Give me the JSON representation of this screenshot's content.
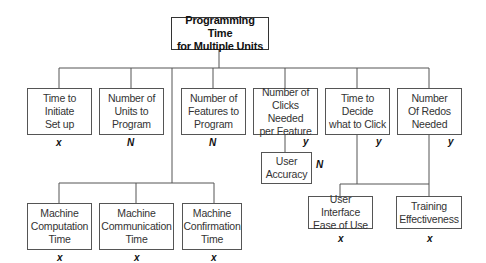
{
  "root": {
    "label": "Programming Time\nfor Multiple Units"
  },
  "nodes": [
    {
      "id": "time-initiate",
      "label": "Time to\nInitiate\nSet up",
      "var": "x"
    },
    {
      "id": "units-program",
      "label": "Number of\nUnits to\nProgram",
      "var": "N"
    },
    {
      "id": "features-program",
      "label": "Number of\nFeatures to\nProgram",
      "var": "N"
    },
    {
      "id": "clicks-needed",
      "label": "Number of\nClicks Needed\nper Feature",
      "var": "y"
    },
    {
      "id": "time-decide",
      "label": "Time to\nDecide\nwhat to Click",
      "var": "y"
    },
    {
      "id": "redos-needed",
      "label": "Number\nOf Redos\nNeeded",
      "var": "y"
    },
    {
      "id": "user-accuracy",
      "label": "User\nAccuracy",
      "var": "N"
    },
    {
      "id": "machine-computation",
      "label": "Machine\nComputation\nTime",
      "var": "x"
    },
    {
      "id": "machine-communication",
      "label": "Machine\nCommunication\nTime",
      "var": "x"
    },
    {
      "id": "machine-confirmation",
      "label": "Machine\nConfirmation\nTime",
      "var": "x"
    },
    {
      "id": "ui-ease",
      "label": "User Interface\nEase of Use",
      "var": "x"
    },
    {
      "id": "training",
      "label": "Training\nEffectiveness",
      "var": "x"
    }
  ]
}
